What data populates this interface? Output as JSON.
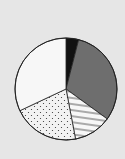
{
  "chart_data": {
    "type": "pie",
    "title": "",
    "labels": [
      "Black",
      "Dark gray",
      "Striped",
      "Dotted",
      "White"
    ],
    "values": [
      4,
      31,
      12,
      21,
      32
    ],
    "fills": [
      "#111111",
      "#6e6e6e",
      "hatch",
      "dots",
      "#f7f7f7"
    ],
    "start_angle_deg": 0,
    "direction": "clockwise",
    "legend": "none"
  }
}
